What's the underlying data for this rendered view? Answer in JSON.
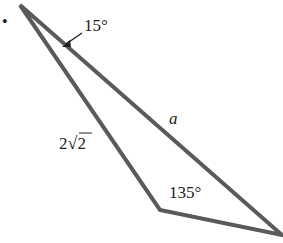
{
  "figure": {
    "bullet": "•",
    "angle_top": "15°",
    "side_a": "a",
    "side_left_coef": "2",
    "side_left_radicand": "2",
    "angle_bottom": "135°",
    "line_color": "#5a5a5a"
  }
}
